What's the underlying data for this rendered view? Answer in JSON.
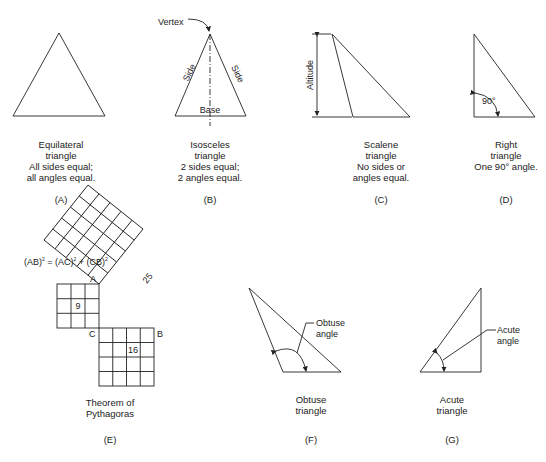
{
  "figure": {
    "panels": [
      {
        "id": "A",
        "tag": "(A)",
        "caption": [
          "Equilateral",
          "triangle",
          "All sides equal;",
          "all angles equal."
        ]
      },
      {
        "id": "B",
        "tag": "(B)",
        "caption": [
          "Isosceles",
          "triangle",
          "2 sides equal;",
          "2 angles equal."
        ],
        "labels": {
          "vertex": "Vertex",
          "side": "Side",
          "base": "Base"
        }
      },
      {
        "id": "C",
        "tag": "(C)",
        "caption": [
          "Scalene",
          "triangle",
          "No sides or",
          "angles equal."
        ],
        "labels": {
          "altitude": "Altitude"
        }
      },
      {
        "id": "D",
        "tag": "(D)",
        "caption": [
          "Right",
          "triangle",
          "One 90° angle."
        ],
        "labels": {
          "angle": "90°"
        }
      },
      {
        "id": "E",
        "tag": "(E)",
        "caption": [
          "Theorem of",
          "Pythagoras"
        ],
        "labels": {
          "equation_lhs": "(AB)",
          "equation_mid": " = (AC)",
          "equation_rhs": " + (CB)",
          "sup": "2",
          "a": "A",
          "b": "B",
          "c": "C",
          "sq9": "9",
          "sq16": "16",
          "sq25": "25"
        }
      },
      {
        "id": "F",
        "tag": "(F)",
        "caption": [
          "Obtuse",
          "triangle"
        ],
        "labels": {
          "line1": "Obtuse",
          "line2": "angle"
        }
      },
      {
        "id": "G",
        "tag": "(G)",
        "caption": [
          "Acute",
          "triangle"
        ],
        "labels": {
          "line1": "Acute",
          "line2": "angle"
        }
      }
    ],
    "colors": {
      "stroke": "#222222",
      "background": "#ffffff"
    }
  }
}
